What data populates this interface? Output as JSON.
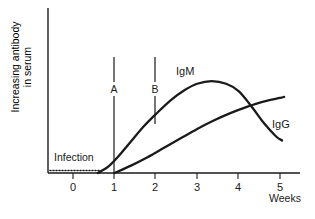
{
  "chart_data": {
    "type": "line",
    "title": "",
    "xlabel": "Weeks",
    "ylabel_line1": "Increasing antibody",
    "ylabel_line2": "in serum",
    "xlim": [
      -0.45,
      5.45
    ],
    "ylim": [
      0,
      1.0
    ],
    "grid": false,
    "legend_position": "inline-at-curve",
    "x_ticks": [
      0,
      1,
      2,
      3,
      4,
      5
    ],
    "x_tick_labels": [
      "0",
      "1",
      "2",
      "3",
      "4",
      "5"
    ],
    "y_ticks": [],
    "y_tick_labels": [],
    "series": [
      {
        "name": "IgM",
        "label": "IgM",
        "color": "#1a1a1a",
        "points": [
          [
            0.6,
            0.0
          ],
          [
            0.85,
            0.06
          ],
          [
            1.1,
            0.16
          ],
          [
            1.4,
            0.3
          ],
          [
            1.7,
            0.44
          ],
          [
            2.0,
            0.56
          ],
          [
            2.35,
            0.69
          ],
          [
            2.7,
            0.79
          ],
          [
            3.0,
            0.85
          ],
          [
            3.35,
            0.875
          ],
          [
            3.7,
            0.85
          ],
          [
            4.0,
            0.78
          ],
          [
            4.3,
            0.64
          ],
          [
            4.6,
            0.48
          ],
          [
            4.9,
            0.35
          ],
          [
            5.05,
            0.31
          ]
        ]
      },
      {
        "name": "IgG",
        "label": "IgG",
        "color": "#1a1a1a",
        "points": [
          [
            1.0,
            0.0
          ],
          [
            1.4,
            0.07
          ],
          [
            1.8,
            0.15
          ],
          [
            2.2,
            0.24
          ],
          [
            2.6,
            0.33
          ],
          [
            3.0,
            0.42
          ],
          [
            3.4,
            0.5
          ],
          [
            3.8,
            0.57
          ],
          [
            4.2,
            0.63
          ],
          [
            4.6,
            0.68
          ],
          [
            5.0,
            0.715
          ],
          [
            5.1,
            0.725
          ]
        ]
      }
    ],
    "annotations": [
      {
        "name": "infection-marker",
        "label": "Infection",
        "style": "dotted-baseline",
        "x_start": 0,
        "x_end": 0.62,
        "y": 0
      },
      {
        "name": "timepoint-a",
        "label": "A",
        "style": "vertical-pointer",
        "x": 1.0,
        "y_top": 0.95,
        "y_bottom": 0.0
      },
      {
        "name": "timepoint-b",
        "label": "B",
        "style": "vertical-pointer",
        "x": 2.0,
        "y_top": 0.95,
        "y_bottom": 0.44
      }
    ],
    "curve_crossing": {
      "x": 4.2,
      "y": 0.645
    }
  },
  "labels": {
    "igm": "IgM",
    "igg": "IgG",
    "infection": "Infection",
    "marker_a": "A",
    "marker_b": "B",
    "weeks": "Weeks",
    "y_axis_line1": "Increasing antibody",
    "y_axis_line2": "in serum",
    "tick_0": "0",
    "tick_1": "1",
    "tick_2": "2",
    "tick_3": "3",
    "tick_4": "4",
    "tick_5": "5"
  },
  "colors": {
    "ink": "#1a1a1a",
    "background": "#ffffff"
  }
}
